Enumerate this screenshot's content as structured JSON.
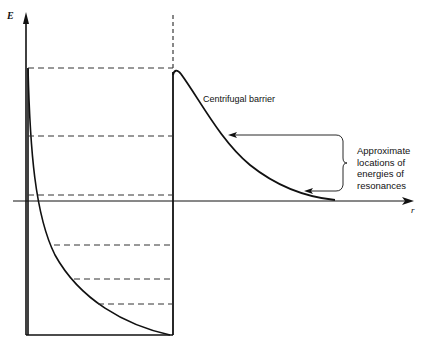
{
  "diagram": {
    "axes": {
      "y_label": "E",
      "x_label": "r"
    },
    "labels": {
      "barrier": "Centrifugal barrier",
      "resonance_note": "Approximate locations of energies of resonances"
    },
    "energy_levels_y_px": [
      68,
      136,
      195,
      245,
      279,
      304
    ],
    "colors": {
      "line": "#111111",
      "background": "#ffffff"
    }
  }
}
